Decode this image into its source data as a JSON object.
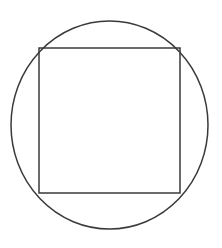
{
  "figure": {
    "canvas": {
      "width": 222,
      "height": 248,
      "background_color": "#ffffff"
    },
    "style": {
      "stroke_color": "#3a3a3a",
      "stroke_width": 1.5,
      "fill": "none"
    },
    "shapes": [
      {
        "name": "circle",
        "type": "ellipse",
        "center_x": 109.5,
        "center_y": 125,
        "radius_x": 98.5,
        "radius_y": 104,
        "left": 11,
        "right": 208,
        "top": 21,
        "bottom": 229
      },
      {
        "name": "square",
        "type": "rect",
        "left": 39,
        "top": 48,
        "right": 180,
        "bottom": 193,
        "width": 141,
        "height": 145,
        "corners": [
          [
            39,
            48
          ],
          [
            180,
            48
          ],
          [
            180,
            193
          ],
          [
            39,
            193
          ]
        ]
      }
    ]
  }
}
